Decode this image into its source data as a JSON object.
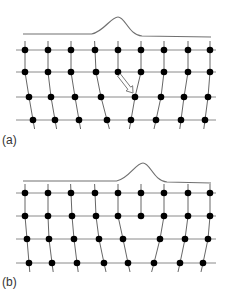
{
  "colors": {
    "grid_line": "#8a8a8a",
    "column_line": "#555555",
    "atom": "#000000",
    "pulse": "#707070",
    "arrow_stroke": "#7a7a7a",
    "arrow_fill": "#ffffff"
  },
  "panels": [
    {
      "id": "a",
      "label": "(a)",
      "label_pos": [
        2,
        144
      ],
      "pulse": {
        "baseline_y": 34,
        "x_start": 23,
        "x_end": 211,
        "peak_x": 118,
        "peak_y": 17,
        "left_y": 34,
        "right_y": 37
      },
      "row_lines": {
        "x1": 16,
        "x2": 216
      },
      "rows": [
        {
          "y": 50,
          "xs": [
            25,
            48,
            71,
            95,
            118,
            141,
            164,
            188,
            210
          ]
        },
        {
          "y": 72,
          "xs": [
            25,
            48,
            71,
            96,
            118,
            141,
            164,
            188,
            210
          ]
        },
        {
          "y": 97,
          "xs": [
            29,
            51,
            75,
            101,
            135,
            161,
            184,
            208
          ]
        },
        {
          "y": 120,
          "xs": [
            33,
            55,
            79,
            107,
            131,
            156,
            181,
            205
          ]
        }
      ],
      "arrow": {
        "from": [
          119,
          75
        ],
        "to": [
          133,
          93
        ]
      }
    },
    {
      "id": "b",
      "label": "(b)",
      "label_pos": [
        2,
        286
      ],
      "pulse": {
        "baseline_y": 181,
        "x_start": 23,
        "x_end": 211,
        "peak_x": 143,
        "peak_y": 163,
        "left_y": 181,
        "right_y": 183
      },
      "row_lines": {
        "x1": 16,
        "x2": 216
      },
      "rows": [
        {
          "y": 193,
          "xs": [
            25,
            48,
            71,
            95,
            118,
            141,
            164,
            188,
            210
          ]
        },
        {
          "y": 216,
          "xs": [
            25,
            48,
            72,
            96,
            118,
            141,
            164,
            188,
            210
          ]
        },
        {
          "y": 239,
          "xs": [
            27,
            49,
            74,
            99,
            123,
            160,
            185,
            208
          ]
        },
        {
          "y": 263,
          "xs": [
            29,
            52,
            77,
            104,
            128,
            154,
            180,
            203
          ]
        }
      ],
      "columns": [
        [
          0,
          0,
          0,
          0
        ],
        [
          1,
          1,
          1,
          1
        ],
        [
          2,
          2,
          2,
          2
        ],
        [
          3,
          3,
          3,
          3
        ],
        [
          4,
          4,
          4,
          4
        ],
        [
          5,
          5,
          null,
          null
        ],
        [
          6,
          6,
          5,
          5
        ],
        [
          7,
          7,
          6,
          6
        ],
        [
          8,
          8,
          7,
          7
        ]
      ]
    }
  ],
  "columns_a": [
    [
      0,
      0,
      0,
      0
    ],
    [
      1,
      1,
      1,
      1
    ],
    [
      2,
      2,
      2,
      2
    ],
    [
      3,
      3,
      3,
      3
    ],
    [
      4,
      4,
      null,
      null
    ],
    [
      5,
      5,
      4,
      4
    ],
    [
      6,
      6,
      5,
      5
    ],
    [
      7,
      7,
      6,
      6
    ],
    [
      8,
      8,
      7,
      7
    ]
  ]
}
